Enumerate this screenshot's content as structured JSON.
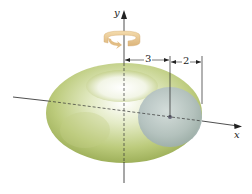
{
  "figure": {
    "type": "torus-solid-of-revolution",
    "axes": {
      "x_label": "x",
      "y_label": "y"
    },
    "dimensions": {
      "center_distance": "3",
      "radius": "2"
    },
    "colors": {
      "torus_light": "#eef3dc",
      "torus_mid": "#c8d48e",
      "torus_dark": "#a3b45e",
      "cross_section": "#b9c6c6",
      "rotation_arrow": "#e8c48c",
      "axis": "#222222"
    }
  }
}
